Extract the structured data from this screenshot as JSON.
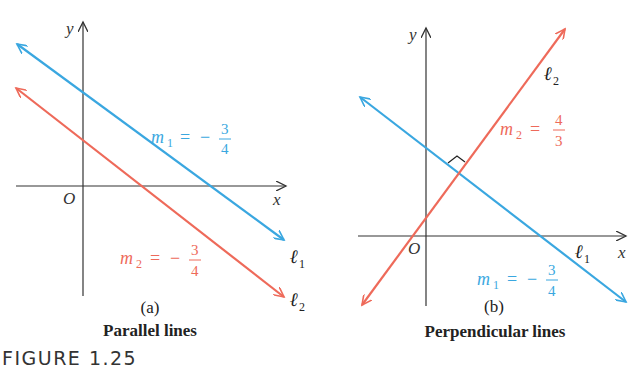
{
  "figure": {
    "label": "FIGURE 1.25",
    "panels": [
      {
        "id": "a",
        "sublabel": "(a)",
        "caption": "Parallel lines",
        "axes": {
          "x": "x",
          "y": "y",
          "origin": "O"
        },
        "lines": [
          {
            "name": "ℓ",
            "sub": "1",
            "slope_label": "m",
            "slope_sub": "1",
            "eq": "=",
            "sign": "−",
            "num": "3",
            "den": "4",
            "color": "#3aa7e0"
          },
          {
            "name": "ℓ",
            "sub": "2",
            "slope_label": "m",
            "slope_sub": "2",
            "eq": "=",
            "sign": "−",
            "num": "3",
            "den": "4",
            "color": "#ee6a5a"
          }
        ]
      },
      {
        "id": "b",
        "sublabel": "(b)",
        "caption": "Perpendicular lines",
        "axes": {
          "x": "x",
          "y": "y",
          "origin": "O"
        },
        "lines": [
          {
            "name": "ℓ",
            "sub": "1",
            "slope_label": "m",
            "slope_sub": "1",
            "eq": "=",
            "sign": "−",
            "num": "3",
            "den": "4",
            "color": "#3aa7e0"
          },
          {
            "name": "ℓ",
            "sub": "2",
            "slope_label": "m",
            "slope_sub": "2",
            "eq": "=",
            "sign": "",
            "num": "4",
            "den": "3",
            "color": "#ee6a5a"
          }
        ],
        "right_angle_marker": true
      }
    ]
  },
  "colors": {
    "blue": "#3aa7e0",
    "red": "#ee6a5a",
    "axis": "#333333",
    "text": "#222222"
  }
}
